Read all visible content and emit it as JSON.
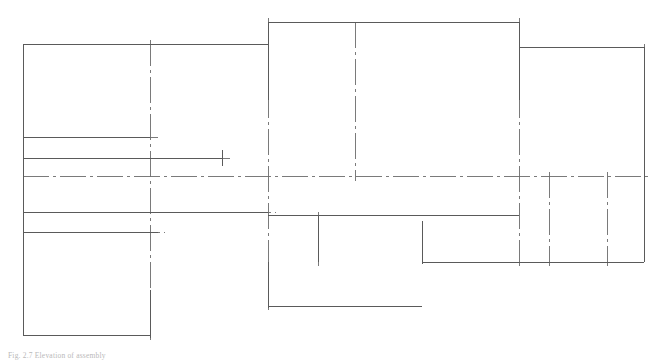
{
  "document": {
    "type": "engineering-drawing",
    "view": "elevation-outline",
    "caption": "Fig. 2.7  Elevation of assembly"
  },
  "canvas": {
    "width": 667,
    "height": 360,
    "background": "#ffffff"
  },
  "style": {
    "outline_color": "#5a5a5a",
    "center_color": "#6b6b6b",
    "outline_width": 1.0,
    "center_width": 0.9,
    "center_dash": "26 4 3 4",
    "caption_color": "#b9b9b9"
  },
  "geometry": {
    "outline": [
      {
        "name": "left-box-top-edge",
        "x1": 23,
        "y1": 44,
        "x2": 158,
        "y2": 44
      },
      {
        "name": "left-box-left-edge",
        "x1": 23,
        "y1": 44,
        "x2": 23,
        "y2": 335
      },
      {
        "name": "left-box-bottom-edge",
        "x1": 23,
        "y1": 335,
        "x2": 150,
        "y2": 335
      },
      {
        "name": "left-box-right-edge",
        "x1": 150,
        "y1": 290,
        "x2": 150,
        "y2": 338
      },
      {
        "name": "upper-left-ledge",
        "x1": 150,
        "y1": 44,
        "x2": 268,
        "y2": 44
      },
      {
        "name": "center-box-top-edge",
        "x1": 268,
        "y1": 22,
        "x2": 519,
        "y2": 22
      },
      {
        "name": "center-box-left-edge",
        "x1": 268,
        "y1": 22,
        "x2": 268,
        "y2": 100
      },
      {
        "name": "right-step-vertical",
        "x1": 519,
        "y1": 22,
        "x2": 519,
        "y2": 100
      },
      {
        "name": "right-box-top-edge",
        "x1": 519,
        "y1": 47,
        "x2": 644,
        "y2": 47
      },
      {
        "name": "right-box-right-edge",
        "x1": 644,
        "y1": 47,
        "x2": 644,
        "y2": 262
      },
      {
        "name": "right-box-bottom-edge",
        "x1": 422,
        "y1": 262,
        "x2": 644,
        "y2": 262
      },
      {
        "name": "notch-vertical",
        "x1": 422,
        "y1": 221,
        "x2": 422,
        "y2": 264
      },
      {
        "name": "notch-bottom-edge",
        "x1": 268,
        "y1": 306,
        "x2": 422,
        "y2": 306
      },
      {
        "name": "lower-center-left-edge",
        "x1": 268,
        "y1": 262,
        "x2": 268,
        "y2": 308
      },
      {
        "name": "mid-shelf-edge",
        "x1": 268,
        "y1": 215,
        "x2": 519,
        "y2": 215
      },
      {
        "name": "mid-shelf-left-drop",
        "x1": 318,
        "y1": 215,
        "x2": 318,
        "y2": 262
      },
      {
        "name": "left-shelf-upper",
        "x1": 23,
        "y1": 137,
        "x2": 150,
        "y2": 137
      },
      {
        "name": "left-shelf-mid",
        "x1": 23,
        "y1": 158,
        "x2": 222,
        "y2": 158
      },
      {
        "name": "left-shelf-lower",
        "x1": 23,
        "y1": 232,
        "x2": 158,
        "y2": 232
      },
      {
        "name": "left-axis-extend",
        "x1": 23,
        "y1": 212,
        "x2": 268,
        "y2": 212
      },
      {
        "name": "short-tick-vertical",
        "x1": 222,
        "y1": 150,
        "x2": 222,
        "y2": 166
      }
    ],
    "centerlines": [
      {
        "name": "main-horizontal-centerline",
        "x1": 23,
        "y1": 176,
        "x2": 650,
        "y2": 176
      },
      {
        "name": "upper-shelf-centerline",
        "x1": 23,
        "y1": 137,
        "x2": 158,
        "y2": 137
      },
      {
        "name": "mid-shelf-centerline",
        "x1": 23,
        "y1": 158,
        "x2": 230,
        "y2": 158
      },
      {
        "name": "lower-shelf-centerline",
        "x1": 23,
        "y1": 232,
        "x2": 165,
        "y2": 232
      },
      {
        "name": "left-extend-centerline",
        "x1": 23,
        "y1": 212,
        "x2": 276,
        "y2": 212
      },
      {
        "name": "left-box-vertical-center",
        "x1": 150,
        "y1": 40,
        "x2": 150,
        "y2": 340
      },
      {
        "name": "center-box-vertical-center",
        "x1": 268,
        "y1": 18,
        "x2": 268,
        "y2": 310
      },
      {
        "name": "center-mid-vertical",
        "x1": 355,
        "y1": 22,
        "x2": 355,
        "y2": 181
      },
      {
        "name": "notch-vertical-center",
        "x1": 318,
        "y1": 212,
        "x2": 318,
        "y2": 266
      },
      {
        "name": "step-vertical-center",
        "x1": 519,
        "y1": 18,
        "x2": 519,
        "y2": 266
      },
      {
        "name": "right-vertical-a",
        "x1": 549,
        "y1": 172,
        "x2": 549,
        "y2": 266
      },
      {
        "name": "right-vertical-b",
        "x1": 607,
        "y1": 172,
        "x2": 607,
        "y2": 266
      },
      {
        "name": "right-edge-center",
        "x1": 644,
        "y1": 44,
        "x2": 644,
        "y2": 266
      }
    ]
  }
}
